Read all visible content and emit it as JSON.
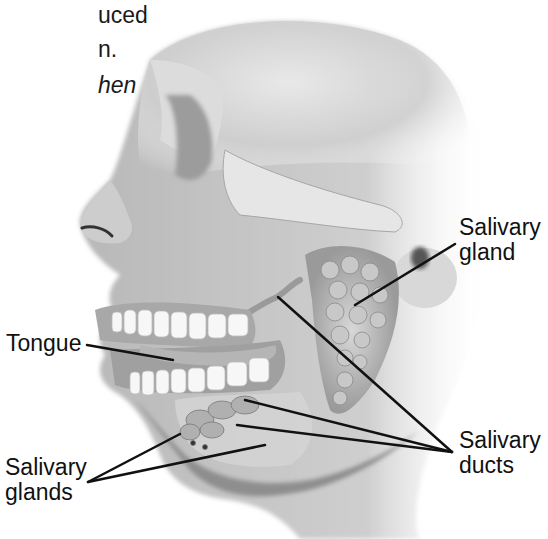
{
  "figure": {
    "type": "anatomical-diagram"
  },
  "body_text_fragment": {
    "lines": [
      "uced",
      "n.",
      "hen"
    ]
  },
  "labels": {
    "tongue": "Tongue",
    "salivary_gland": {
      "line1": "Salivary",
      "line2": "gland"
    },
    "salivary_ducts": {
      "line1": "Salivary",
      "line2": "ducts"
    },
    "salivary_glands": {
      "line1": "Salivary",
      "line2": "glands"
    }
  },
  "colors": {
    "background": "#ffffff",
    "skin_light": "#e4e4e4",
    "skin_mid": "#bdbdbd",
    "skin_dark": "#8c8c8c",
    "teeth": "#f7f7f7",
    "leader_line": "#111111",
    "text": "#111111"
  }
}
